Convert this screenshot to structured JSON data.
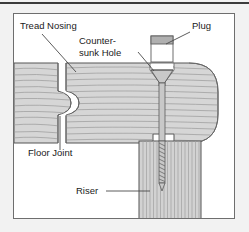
{
  "figure": {
    "title_visible": false,
    "panel": {
      "background": "#ffffff",
      "border_color": "#6e6e6e"
    },
    "page_background": "#f2f2f2",
    "top_rule_color": "#3c3c3c"
  },
  "colors": {
    "wood_fill": "#d6d6d6",
    "wood_grain": "#9a9a9a",
    "wood_outline": "#555555",
    "riser_fill": "#d2d2d2",
    "riser_grain": "#a0a0a0",
    "plug_body": "#ffffff",
    "plug_top_band": "#b0b0b0",
    "screw_fill": "#c8c8c8",
    "screw_outline": "#5a5a5a",
    "hole_fill": "#ffffff",
    "leader_line": "#4a4a4a",
    "label_text": "#1a1a1a"
  },
  "labels": [
    {
      "id": "tread-nosing",
      "text": "Tread Nosing",
      "x": 6,
      "y": 15,
      "anchor": "start",
      "leader": {
        "x1": 28,
        "y1": 20,
        "x2": 62,
        "y2": 58
      }
    },
    {
      "id": "countersunk-hole",
      "text_line1": "Counter-",
      "text_line2": "sunk Hole",
      "x": 65,
      "y": 30,
      "y2": 42,
      "anchor": "start",
      "leader": {
        "x1": 124,
        "y1": 38,
        "x2": 146,
        "y2": 60
      }
    },
    {
      "id": "plug",
      "text": "Plug",
      "x": 178,
      "y": 15,
      "anchor": "start",
      "leader": {
        "x1": 176,
        "y1": 18,
        "x2": 152,
        "y2": 30
      }
    },
    {
      "id": "floor-joint",
      "text": "Floor Joint",
      "x": 14,
      "y": 142,
      "anchor": "start",
      "leader": {
        "x1": 46,
        "y1": 136,
        "x2": 46,
        "y2": 102
      }
    },
    {
      "id": "riser",
      "text": "Riser",
      "x": 62,
      "y": 180,
      "anchor": "start",
      "leader": {
        "x1": 92,
        "y1": 177,
        "x2": 136,
        "y2": 177
      }
    }
  ],
  "parts": {
    "tread": {
      "name": "Tread Nosing",
      "grain_direction": "horizontal",
      "grain_line_count": 13,
      "nosing_profile": "bullnose"
    },
    "floor_block": {
      "name": "Floor board at joint",
      "grain_direction": "horizontal",
      "grain_line_count": 11,
      "joint_type": "tongue-and-groove rounded"
    },
    "riser": {
      "name": "Riser",
      "grain_direction": "vertical",
      "grain_line_count": 17
    },
    "plug": {
      "name": "Plug",
      "shape": "cylindrical dowel plug",
      "shown": "exploded above hole"
    },
    "countersunk_hole": {
      "name": "Counter-sunk Hole",
      "shape": "conical seat with straight bore"
    },
    "screw": {
      "name": "Wood screw",
      "head": "flat countersunk",
      "shank": "smooth upper shank",
      "threads": "lower threaded portion",
      "thread_turn_count": 20,
      "tip": "pointed"
    }
  }
}
